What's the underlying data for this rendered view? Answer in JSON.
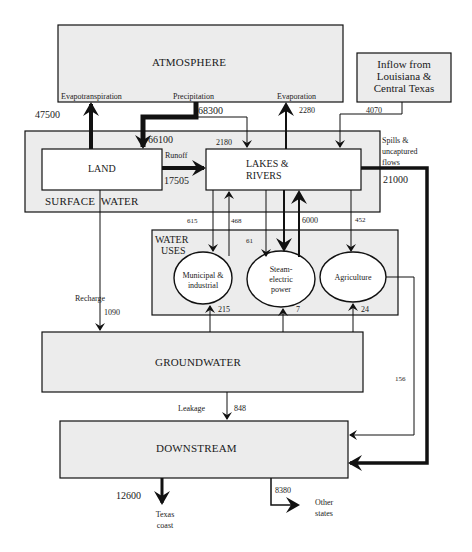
{
  "nodes": {
    "atmosphere": {
      "label": "ATMOSPHERE"
    },
    "inflow": {
      "label_line1": "Inflow from",
      "label_line2": "Louisiana &",
      "label_line3": "Central Texas"
    },
    "surface_water": {
      "label": "SURFACE WATER"
    },
    "land": {
      "label": "LAND"
    },
    "lakes_rivers": {
      "label_line1": "LAKES &",
      "label_line2": "RIVERS"
    },
    "water_uses": {
      "label_line1": "WATER",
      "label_line2": "USES"
    },
    "municipal": {
      "label_line1": "Municipal &",
      "label_line2": "industrial"
    },
    "steam": {
      "label_line1": "Steam-",
      "label_line2": "electric",
      "label_line3": "power"
    },
    "agriculture": {
      "label": "Agriculture"
    },
    "groundwater": {
      "label": "GROUNDWATER"
    },
    "downstream": {
      "label": "DOWNSTREAM"
    },
    "texas_coast": {
      "label_line1": "Texas",
      "label_line2": "coast"
    },
    "other_states": {
      "label_line1": "Other",
      "label_line2": "states"
    }
  },
  "flows": {
    "evapotranspiration": {
      "label": "Evapotranspiration",
      "value": "47500"
    },
    "precipitation": {
      "label": "Precipitation",
      "value": "68300",
      "to_land": "66100",
      "to_lakes": "2180"
    },
    "evaporation": {
      "label": "Evaporation",
      "value": "2280"
    },
    "inflow": {
      "value": "4070"
    },
    "runoff": {
      "label": "Runoff",
      "value": "17505"
    },
    "spills": {
      "label_line1": "Spills &",
      "label_line2": "uncaptured",
      "label_line3": "flows",
      "value": "21000"
    },
    "lakes_to_municipal": {
      "value": "615"
    },
    "municipal_to_lakes": {
      "value": "468"
    },
    "lakes_to_steam_small": {
      "value": "61"
    },
    "steam_to_lakes": {
      "value": "6000"
    },
    "lakes_to_agriculture": {
      "value": "452"
    },
    "recharge": {
      "label": "Recharge",
      "value": "1090"
    },
    "gw_to_municipal": {
      "value": "215"
    },
    "gw_to_steam": {
      "value": "7"
    },
    "gw_to_agriculture": {
      "value": "24"
    },
    "agriculture_return": {
      "value": "156"
    },
    "leakage": {
      "label": "Leakage",
      "value": "848"
    },
    "to_texas_coast": {
      "value": "12600"
    },
    "to_other_states": {
      "value": "8380"
    }
  },
  "colors": {
    "box_fill": "#ececec",
    "inner_fill": "#ffffff",
    "stroke": "#111111"
  }
}
